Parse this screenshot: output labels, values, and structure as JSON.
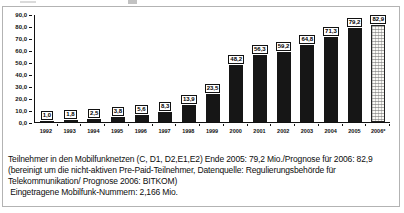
{
  "chart_data": {
    "type": "bar",
    "title": "",
    "xlabel": "",
    "ylabel": "",
    "categories": [
      "1992",
      "1993",
      "1994",
      "1995",
      "1996",
      "1997",
      "1998",
      "1999",
      "2000",
      "2001",
      "2002",
      "2003",
      "2004",
      "2005",
      "2006*"
    ],
    "values": [
      1.0,
      1.8,
      2.5,
      3.8,
      5.6,
      8.3,
      13.9,
      23.5,
      48.2,
      56.3,
      59.2,
      64.8,
      71.3,
      79.2,
      82.9
    ],
    "value_labels": [
      "1,0",
      "1,8",
      "2,5",
      "3,8",
      "5,6",
      "8,3",
      "13,9",
      "23,5",
      "48,2",
      "56,3",
      "59,2",
      "64,8",
      "71,3",
      "79,2",
      "82,9"
    ],
    "ylim": [
      0,
      90
    ],
    "y_ticks": [
      "90,0",
      "80,0",
      "70,0",
      "60,0",
      "50,0",
      "40,0",
      "30,0",
      "20,0",
      "10,0",
      "0,0"
    ],
    "grid": false,
    "legend": false,
    "bar_color": "#161616",
    "forecast_bar_index": 14,
    "forecast_bar_style": "light dotted-grid pattern with dark outline",
    "frame_border_color": "#b3b3b3",
    "axis_color": "#111111"
  },
  "caption": {
    "lines": [
      "Teilnehmer in den Mobilfunknetzen (C, D1, D2,E1,E2) Ende 2005: 79,2 Mio./Prognose für 2006: 82,9",
      "(bereinigt um die nicht-aktiven Pre-Paid-Teilnehmer, Datenquelle: Regulierungsbehörde für",
      "Telekommunikation/ Prognose 2006: BITKOM)",
      " Eingetragene Mobilfunk-Nummern: 2,166 Mio."
    ]
  }
}
